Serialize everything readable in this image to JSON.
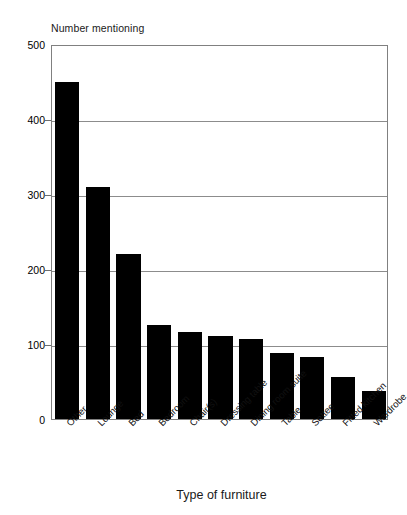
{
  "chart_data": {
    "type": "bar",
    "title": "",
    "ylabel": "Number mentioning",
    "xlabel": "Type of furniture",
    "ylim": [
      0,
      500
    ],
    "yticks": [
      0,
      100,
      200,
      300,
      400,
      500
    ],
    "ytick_labels": [
      "0",
      "100",
      "200",
      "300",
      "400",
      "500"
    ],
    "grid": true,
    "legend": "none",
    "bar_color": "#000000",
    "grid_color": "#8c8c8c",
    "axis_color": "#808080",
    "categories": [
      "Other",
      "Lounge",
      "Bed",
      "Bedroom",
      "Chair(s)",
      "Dressing table",
      "Dining room suite",
      "Table",
      "Settee",
      "Fitted kitchen",
      "Wardrobe"
    ],
    "values": [
      450,
      310,
      220,
      125,
      116,
      111,
      107,
      88,
      83,
      56,
      37
    ]
  }
}
